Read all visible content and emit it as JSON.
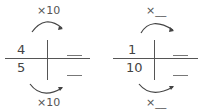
{
  "left": {
    "top_label": "×10",
    "bottom_label": "×10",
    "numerator": "4",
    "denominator": "5"
  },
  "right": {
    "top_label": "×__",
    "bottom_label": "×__",
    "numerator": "1",
    "denominator": "10"
  },
  "colors": {
    "line": "#555555",
    "text": "#444444"
  }
}
